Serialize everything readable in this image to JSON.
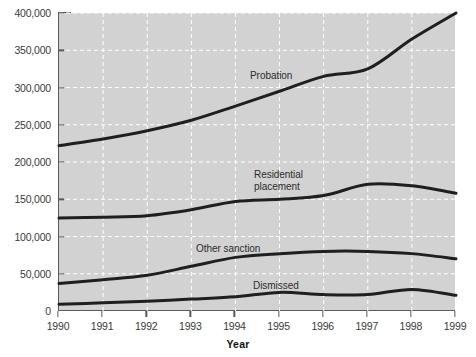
{
  "chart_data": {
    "type": "line",
    "title": "",
    "xlabel": "Year",
    "ylabel": "",
    "x": [
      1990,
      1991,
      1992,
      1993,
      1994,
      1995,
      1996,
      1997,
      1998,
      1999
    ],
    "xtick_labels": [
      "1990",
      "1991",
      "1992",
      "1993",
      "1994",
      "1995",
      "1996",
      "1997",
      "1998",
      "1999"
    ],
    "ytick_labels": [
      "0",
      "50,000",
      "100,000",
      "150,000",
      "200,000",
      "250,000",
      "300,000",
      "350,000",
      "400,000"
    ],
    "ytick_values": [
      0,
      50000,
      100000,
      150000,
      200000,
      250000,
      300000,
      350000,
      400000
    ],
    "ylim": [
      0,
      400000
    ],
    "xlim": [
      1990,
      1999
    ],
    "grid": true,
    "grid_style": "dashed-white",
    "legend_position": "inline-annotations",
    "plot_background": "#d2d2d2",
    "line_color": "#1f1f1f",
    "series": [
      {
        "name": "Probation",
        "label": "Probation",
        "values": [
          222000,
          231000,
          242000,
          256000,
          275000,
          295000,
          315000,
          325000,
          365000,
          400000
        ]
      },
      {
        "name": "Residential placement",
        "label": "Residential\nplacement",
        "values": [
          125000,
          126000,
          128000,
          136000,
          147000,
          150000,
          155000,
          170000,
          168000,
          158000
        ]
      },
      {
        "name": "Other sanction",
        "label": "Other sanction",
        "values": [
          37000,
          42000,
          48000,
          60000,
          72000,
          77000,
          80000,
          80000,
          77000,
          70000
        ]
      },
      {
        "name": "Dismissed",
        "label": "Dismissed",
        "values": [
          9000,
          11000,
          13000,
          16000,
          19000,
          25000,
          22000,
          22000,
          29000,
          21000
        ]
      }
    ],
    "annotations": [
      {
        "text": "Probation",
        "series": "Probation"
      },
      {
        "text": "Residential placement",
        "series": "Residential placement"
      },
      {
        "text": "Other sanction",
        "series": "Other sanction"
      },
      {
        "text": "Dismissed",
        "series": "Dismissed"
      }
    ]
  }
}
